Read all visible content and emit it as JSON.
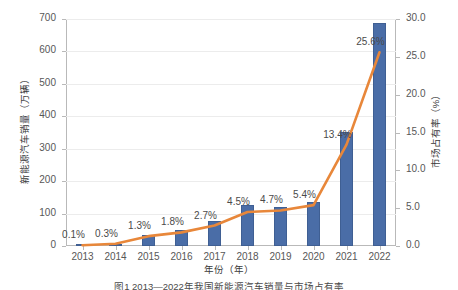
{
  "chart_data": {
    "type": "bar",
    "title": "",
    "caption": "图1 2013—2022年我国新能源汽车销量与市场占有率",
    "xlabel": "年份（年）",
    "ylabel": "新能源汽车销量（万辆）",
    "ylabel_right": "市场占有率（%）",
    "categories": [
      "2013",
      "2014",
      "2015",
      "2016",
      "2017",
      "2018",
      "2019",
      "2020",
      "2021",
      "2022"
    ],
    "ylim": [
      0,
      700
    ],
    "yticks": [
      "0",
      "100",
      "200",
      "300",
      "400",
      "500",
      "600",
      "700"
    ],
    "ylim_right": [
      0,
      30
    ],
    "yticks_right": [
      "0.0",
      "5.0",
      "10.0",
      "15.0",
      "20.0",
      "25.0",
      "30.0"
    ],
    "grid": true,
    "legend": "none",
    "series": [
      {
        "name": "新能源汽车销量（万辆）",
        "type": "bar",
        "axis": "left",
        "color": "#4a6da7",
        "values": [
          1.8,
          7.5,
          33.1,
          50.7,
          77.7,
          125.6,
          120.6,
          136.7,
          352.1,
          688.7
        ]
      },
      {
        "name": "市场占有率（%）",
        "type": "line",
        "axis": "right",
        "color": "#e8873a",
        "values": [
          0.1,
          0.3,
          1.3,
          1.8,
          2.7,
          4.5,
          4.7,
          5.4,
          13.4,
          25.6
        ],
        "labels": [
          "0.1%",
          "0.3%",
          "1.3%",
          "1.8%",
          "2.7%",
          "4.5%",
          "4.7%",
          "5.4%",
          "13.4%",
          "25.6%"
        ]
      }
    ]
  }
}
